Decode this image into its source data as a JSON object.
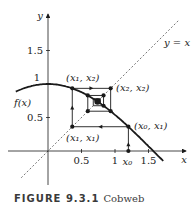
{
  "chart_data": {
    "type": "line",
    "title": "Cobweb",
    "function": "cos(x)",
    "x0": 1.2,
    "iterations": 14,
    "xlim": [
      -0.45,
      1.95
    ],
    "ylim": [
      -0.45,
      1.95
    ],
    "xlabel": "x",
    "ylabel": "y",
    "x_ticks": [
      {
        "value": 0.5,
        "label": "0.5"
      },
      {
        "value": 1,
        "label": "1"
      },
      {
        "value": 1.5,
        "label": "1.5"
      }
    ],
    "y_ticks": [
      {
        "value": 0.5,
        "label": "0.5"
      },
      {
        "value": 1,
        "label": "1"
      },
      {
        "value": 1.5,
        "label": "1.5"
      }
    ],
    "x0_label": "x₀",
    "curve_label": "f(x)",
    "diagonal_label": "y = x",
    "point_labels": {
      "x0_x1": "(x₀, x₁)",
      "x1_x1": "(x₁, x₁)",
      "x1_x2": "(x₁, x₂)",
      "x2_x2": "(x₂, x₂)"
    },
    "grid": false
  },
  "caption": {
    "figure": "FIGURE 9.3.1",
    "text": "Cobweb"
  },
  "colors": {
    "ink": "#1a1a1a",
    "diagonal": "#777777"
  }
}
